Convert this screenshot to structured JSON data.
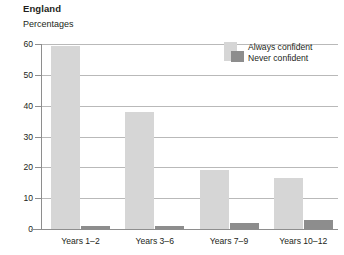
{
  "chart_data": {
    "type": "bar",
    "title": "England",
    "subtitle": "Percentages",
    "xlabel": "",
    "ylabel": "",
    "ylim": [
      0,
      60
    ],
    "yticks": [
      0,
      10,
      20,
      30,
      40,
      50,
      60
    ],
    "ytick_labels": [
      "0",
      "10",
      "20",
      "30",
      "40",
      "50",
      "60"
    ],
    "grid": true,
    "legend_position": "top-right",
    "categories": [
      "Years 1–2",
      "Years 3–6",
      "Years 7–9",
      "Years 10–12"
    ],
    "series": [
      {
        "name": "Always confident",
        "color": "#d6d6d6",
        "values": [
          59.5,
          38,
          19,
          16.5
        ]
      },
      {
        "name": "Never confident",
        "color": "#8d8d8d",
        "values": [
          1,
          1,
          2,
          3
        ]
      }
    ]
  },
  "legend": {
    "items": [
      {
        "label": "Always confident",
        "color": "#d6d6d6"
      },
      {
        "label": "Never confident",
        "color": "#8d8d8d"
      }
    ]
  },
  "axis": {
    "y_labels": [
      "60",
      "50",
      "40",
      "30",
      "20",
      "10",
      "0"
    ],
    "x_labels": [
      "Years 1–2",
      "Years 3–6",
      "Years 7–9",
      "Years 10–12"
    ]
  },
  "colors": {
    "always_confident": "#d6d6d6",
    "never_confident": "#8d8d8d",
    "gridline": "#b9b9b9",
    "axis": "#8e8e8e",
    "text": "#231f20",
    "background": "#ffffff"
  }
}
